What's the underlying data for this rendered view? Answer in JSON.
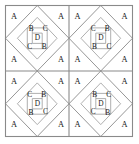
{
  "figure": {
    "background_color": "#ffffff",
    "line_color": "#8a8a8a",
    "border_color": "#8a8a8a",
    "text_color": "#1a1a1a",
    "grid": {
      "rows": 2,
      "columns": 2
    },
    "legend_letters": [
      "A",
      "B",
      "C",
      "D"
    ]
  },
  "tiles": [
    {
      "id": "tile-top-left",
      "position": "top-left",
      "orientation": "normal",
      "corner_labels": {
        "top_left": "A",
        "top_right": "A",
        "bottom_left": "A",
        "bottom_right": "A"
      },
      "inner_labels": {
        "upper_left": "B",
        "upper_right": "C",
        "center": "D",
        "lower_left": "C",
        "lower_right": "B"
      }
    },
    {
      "id": "tile-top-right",
      "position": "top-right",
      "orientation": "mirrored",
      "corner_labels": {
        "top_left": "A",
        "top_right": "A",
        "bottom_left": "A",
        "bottom_right": "A"
      },
      "inner_labels": {
        "upper_left": "C",
        "upper_right": "B",
        "center": "D",
        "lower_left": "B",
        "lower_right": "C"
      }
    },
    {
      "id": "tile-bottom-left",
      "position": "bottom-left",
      "orientation": "mirrored",
      "corner_labels": {
        "top_left": "A",
        "top_right": "A",
        "bottom_left": "A",
        "bottom_right": "A"
      },
      "inner_labels": {
        "upper_left": "C",
        "upper_right": "B",
        "center": "D",
        "lower_left": "B",
        "lower_right": "C"
      }
    },
    {
      "id": "tile-bottom-right",
      "position": "bottom-right",
      "orientation": "normal",
      "corner_labels": {
        "top_left": "A",
        "top_right": "A",
        "bottom_left": "A",
        "bottom_right": "A"
      },
      "inner_labels": {
        "upper_left": "B",
        "upper_right": "C",
        "center": "D",
        "lower_left": "C",
        "lower_right": "B"
      }
    }
  ]
}
